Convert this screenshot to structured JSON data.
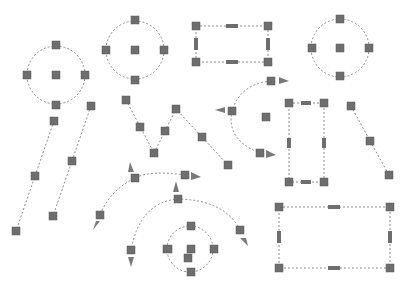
{
  "colors": {
    "background": "#ffffff",
    "path_stroke": "#8c8c8c",
    "handle_fill": "#6e6e6e",
    "arrow_fill": "#7a7a7a"
  },
  "shapes": [
    {
      "id": "circle-left",
      "type": "circle",
      "cx": 56,
      "cy": 75,
      "r": 29,
      "handles": [
        [
          56,
          45
        ],
        [
          27,
          75
        ],
        [
          56,
          75
        ],
        [
          85,
          75
        ],
        [
          56,
          105
        ]
      ]
    },
    {
      "id": "circle-top-middle",
      "type": "circle",
      "cx": 135,
      "cy": 50,
      "r": 29,
      "handles": [
        [
          135,
          20
        ],
        [
          106,
          50
        ],
        [
          135,
          50
        ],
        [
          164,
          50
        ],
        [
          135,
          80
        ]
      ]
    },
    {
      "id": "circle-top-right",
      "type": "circle",
      "cx": 340,
      "cy": 48,
      "r": 29,
      "handles": [
        [
          340,
          19
        ],
        [
          312,
          48
        ],
        [
          340,
          48
        ],
        [
          369,
          48
        ],
        [
          340,
          76
        ]
      ]
    },
    {
      "id": "circle-small-bottom",
      "type": "circle",
      "cx": 190,
      "cy": 249,
      "r": 23,
      "handles": [
        [
          191,
          226
        ],
        [
          167,
          249
        ],
        [
          191,
          249
        ],
        [
          214,
          249
        ],
        [
          191,
          272
        ],
        [
          188,
          258
        ]
      ]
    },
    {
      "id": "rect-top",
      "type": "rect",
      "x": 196,
      "y": 26,
      "w": 72,
      "h": 36,
      "mid_handles": [
        [
          232,
          26
        ],
        [
          232,
          62
        ],
        [
          196,
          44
        ],
        [
          268,
          44
        ]
      ]
    },
    {
      "id": "rect-tall",
      "type": "rect",
      "x": 289,
      "y": 103,
      "w": 35,
      "h": 79,
      "mid_handles": [
        [
          306,
          103
        ],
        [
          306,
          182
        ],
        [
          289,
          143
        ],
        [
          324,
          143
        ]
      ]
    },
    {
      "id": "rect-bottom",
      "type": "rect",
      "x": 279,
      "y": 207,
      "w": 111,
      "h": 61,
      "mid_handles": [
        [
          334,
          207
        ],
        [
          334,
          268
        ],
        [
          279,
          237
        ],
        [
          390,
          237
        ]
      ]
    },
    {
      "id": "line-left-a",
      "type": "line",
      "points": [
        [
          54,
          121
        ],
        [
          35,
          176
        ],
        [
          16,
          231
        ]
      ]
    },
    {
      "id": "line-left-b",
      "type": "line",
      "points": [
        [
          91,
          106
        ],
        [
          72,
          161
        ],
        [
          53,
          216
        ]
      ]
    },
    {
      "id": "line-right",
      "type": "line",
      "points": [
        [
          351,
          106
        ],
        [
          370,
          141
        ],
        [
          389,
          175
        ]
      ]
    },
    {
      "id": "polyline-w",
      "type": "polyline",
      "points": [
        [
          126,
          100
        ],
        [
          140,
          127
        ],
        [
          154,
          153
        ],
        [
          165,
          131
        ],
        [
          176,
          109
        ],
        [
          202,
          137
        ],
        [
          228,
          165
        ]
      ]
    },
    {
      "id": "arc-right-c",
      "type": "arc",
      "handles": [
        [
          271,
          81
        ],
        [
          232,
          111
        ],
        [
          266,
          111
        ],
        [
          260,
          153
        ]
      ],
      "arrows": [
        "right",
        "left",
        "right"
      ]
    },
    {
      "id": "arc-middle",
      "type": "arc",
      "handles": [
        [
          135,
          178
        ],
        [
          185,
          175
        ],
        [
          100,
          215
        ]
      ],
      "arrows": [
        "up",
        "right",
        "down"
      ]
    },
    {
      "id": "arc-large-bottom",
      "type": "arc",
      "handles": [
        [
          178,
          199
        ],
        [
          240,
          230
        ],
        [
          131,
          250
        ]
      ],
      "arrows": [
        "up",
        "down",
        "down"
      ]
    }
  ]
}
